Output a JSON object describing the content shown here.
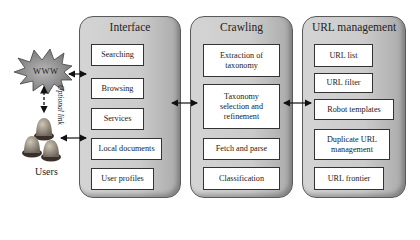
{
  "external": {
    "www_label": "WWW",
    "optional_link_label": "Optional link",
    "users_label": "Users"
  },
  "panels": {
    "interface": {
      "title": "Interface",
      "items": [
        "Searching",
        "Browsing",
        "Services",
        "Local documents",
        "User profiles"
      ]
    },
    "crawling": {
      "title": "Crawling",
      "items": [
        "Extraction of taxonomy",
        "Taxonomy selection and refinement",
        "Fetch and parse",
        "Classification"
      ]
    },
    "url_management": {
      "title": "URL management",
      "items": [
        "URL list",
        "URL filter",
        "Robot templates",
        "Duplicate URL management",
        "URL frontier"
      ]
    }
  },
  "colors": {
    "panel_fill": "#cbcbcb",
    "box_fill": "#ffffff",
    "arrow": "#111111"
  }
}
